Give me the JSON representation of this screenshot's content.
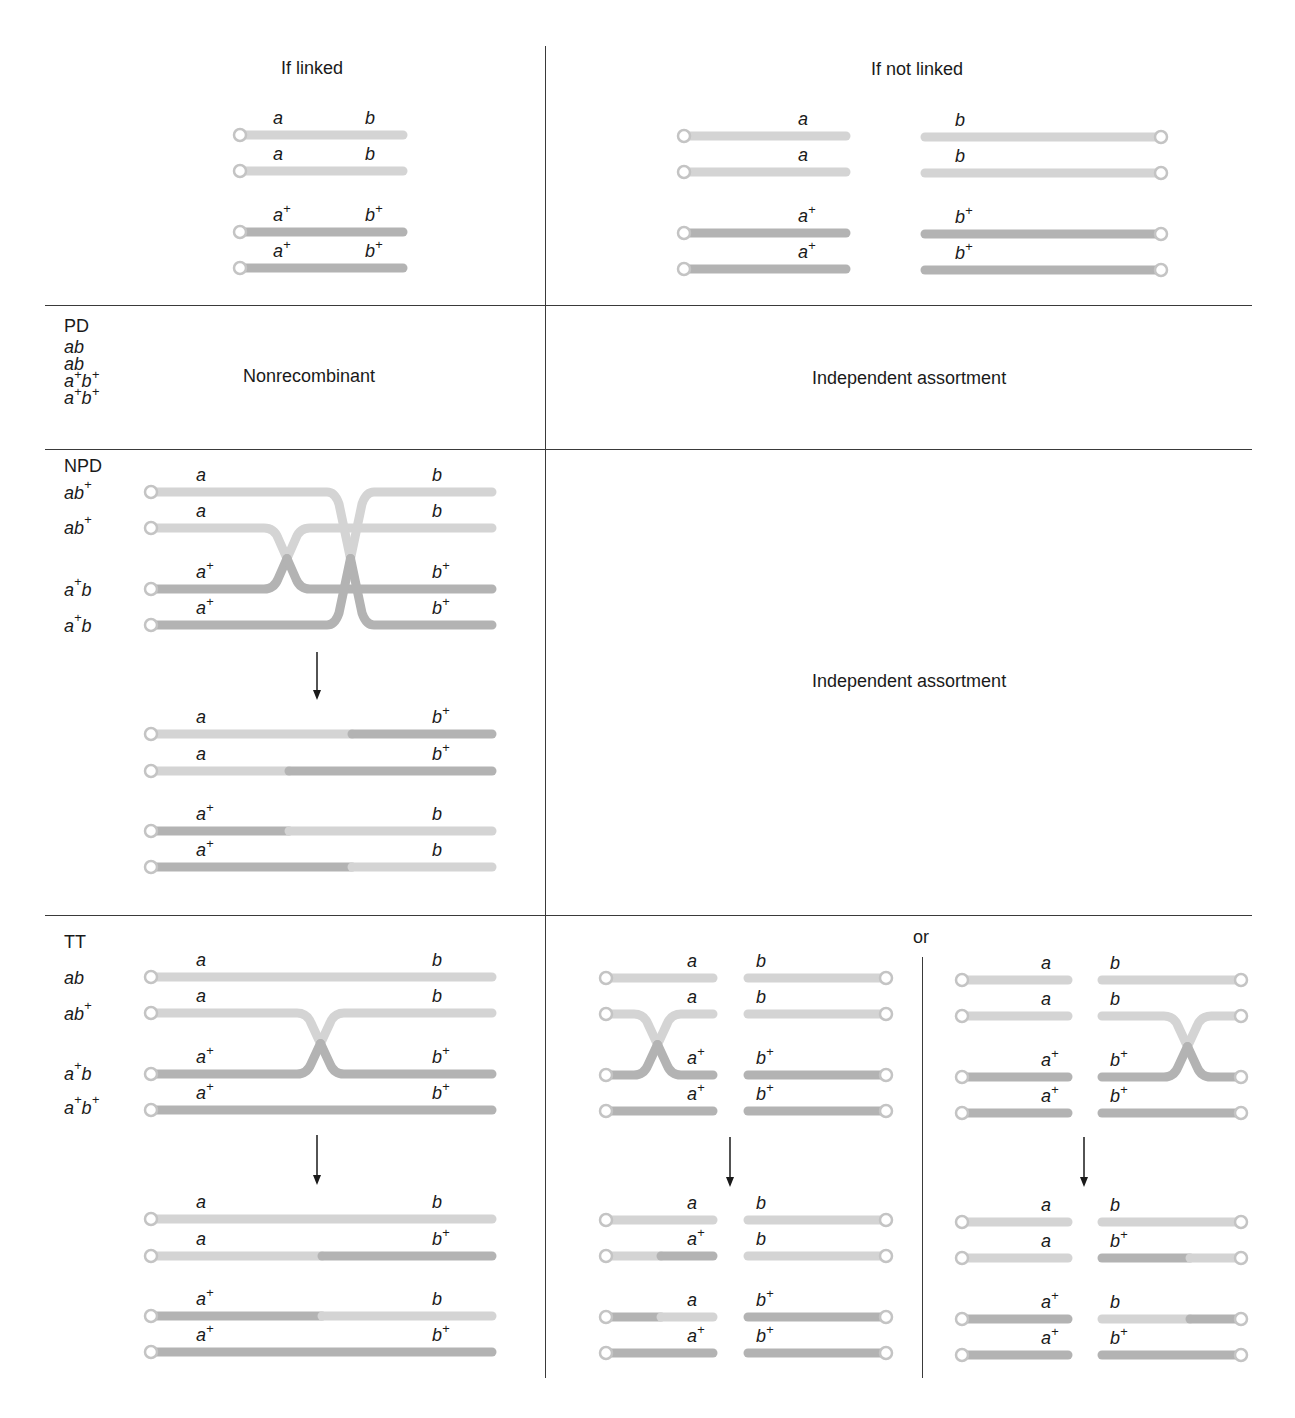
{
  "header": {
    "linked_title": "If linked",
    "not_linked_title": "If not linked"
  },
  "rows": {
    "pd": {
      "label": "PD",
      "genotypes": [
        "ab",
        "ab",
        "a+b+",
        "a+b+"
      ],
      "linked_text": "Nonrecombinant",
      "not_linked_text": "Independent assortment"
    },
    "npd": {
      "label": "NPD",
      "genotypes": [
        "ab+",
        "ab+",
        "a+b",
        "a+b"
      ],
      "not_linked_text": "Independent assortment"
    },
    "tt": {
      "label": "TT",
      "genotypes": [
        "ab",
        "ab+",
        "a+b",
        "a+b+"
      ],
      "or_label": "or"
    }
  },
  "colors": {
    "light_chromatid": "#d4d4d4",
    "dark_chromatid": "#b3b3b3",
    "centromere_stroke": "#c4c4c4",
    "grid_line": "#3a3a3a",
    "arrow": "#1a1a1a"
  },
  "grid": {
    "h_lines_y": [
      305,
      449,
      915
    ],
    "v_line_x": 545,
    "or_divider_x": 922
  },
  "diagrams": [
    {
      "id": "linked-parent",
      "cen": "left",
      "x1": 240,
      "x2": 403,
      "strands": [
        {
          "y": 135,
          "left": "a",
          "right": "b",
          "segs": [
            [
              "L",
              240,
              403
            ]
          ]
        },
        {
          "y": 171,
          "left": "a",
          "right": "b",
          "segs": [
            [
              "L",
              240,
              403
            ]
          ]
        },
        {
          "y": 232,
          "left": "a+",
          "right": "b+",
          "segs": [
            [
              "D",
              240,
              403
            ]
          ]
        },
        {
          "y": 268,
          "left": "a+",
          "right": "b+",
          "segs": [
            [
              "D",
              240,
              403
            ]
          ]
        }
      ],
      "label_left_x": 273,
      "label_right_x": 365
    },
    {
      "id": "unlinked-parent-a",
      "cen": "left",
      "x1": 684,
      "x2": 846,
      "strands": [
        {
          "y": 136,
          "left": "a",
          "segs": [
            [
              "L",
              684,
              846
            ]
          ]
        },
        {
          "y": 172,
          "left": "a",
          "segs": [
            [
              "L",
              684,
              846
            ]
          ]
        },
        {
          "y": 233,
          "left": "a+",
          "segs": [
            [
              "D",
              684,
              846
            ]
          ]
        },
        {
          "y": 269,
          "left": "a+",
          "segs": [
            [
              "D",
              684,
              846
            ]
          ]
        }
      ],
      "label_left_x": 798
    },
    {
      "id": "unlinked-parent-b",
      "cen": "right",
      "x1": 925,
      "x2": 1161,
      "strands": [
        {
          "y": 137,
          "right": "b",
          "segs": [
            [
              "L",
              925,
              1161
            ]
          ]
        },
        {
          "y": 173,
          "right": "b",
          "segs": [
            [
              "L",
              925,
              1161
            ]
          ]
        },
        {
          "y": 234,
          "right": "b+",
          "segs": [
            [
              "D",
              925,
              1161
            ]
          ]
        },
        {
          "y": 270,
          "right": "b+",
          "segs": [
            [
              "D",
              925,
              1161
            ]
          ]
        }
      ],
      "label_right_x": 955
    },
    {
      "id": "npd-result",
      "cen": "left",
      "x1": 151,
      "x2": 492,
      "strands": [
        {
          "y": 734,
          "left": "a",
          "right": "b+",
          "segs": [
            [
              "L",
              151,
              352
            ],
            [
              "D",
              352,
              492
            ]
          ]
        },
        {
          "y": 771,
          "left": "a",
          "right": "b+",
          "segs": [
            [
              "L",
              151,
              289
            ],
            [
              "D",
              289,
              492
            ]
          ]
        },
        {
          "y": 831,
          "left": "a+",
          "right": "b",
          "segs": [
            [
              "D",
              151,
              289
            ],
            [
              "L",
              289,
              492
            ]
          ]
        },
        {
          "y": 867,
          "left": "a+",
          "right": "b",
          "segs": [
            [
              "D",
              151,
              352
            ],
            [
              "L",
              352,
              492
            ]
          ]
        }
      ],
      "label_left_x": 196,
      "label_right_x": 432
    },
    {
      "id": "tt-linked-parent",
      "cen": "left",
      "x1": 151,
      "x2": 492,
      "strands": [
        {
          "y": 977,
          "left": "a",
          "right": "b",
          "segs": [
            [
              "L",
              151,
              492
            ]
          ]
        },
        {
          "y": 1013,
          "left": "a",
          "right": "b",
          "segs": []
        },
        {
          "y": 1074,
          "left": "a+",
          "right": "b+",
          "segs": []
        },
        {
          "y": 1110,
          "left": "a+",
          "right": "b+",
          "segs": [
            [
              "D",
              151,
              492
            ]
          ]
        }
      ],
      "label_left_x": 196,
      "label_right_x": 432
    },
    {
      "id": "tt-linked-result",
      "cen": "left",
      "x1": 151,
      "x2": 492,
      "strands": [
        {
          "y": 1219,
          "left": "a",
          "right": "b",
          "segs": [
            [
              "L",
              151,
              492
            ]
          ]
        },
        {
          "y": 1256,
          "left": "a",
          "right": "b+",
          "segs": [
            [
              "L",
              151,
              322
            ],
            [
              "D",
              322,
              492
            ]
          ]
        },
        {
          "y": 1316,
          "left": "a+",
          "right": "b",
          "segs": [
            [
              "D",
              151,
              322
            ],
            [
              "L",
              322,
              492
            ]
          ]
        },
        {
          "y": 1352,
          "left": "a+",
          "right": "b+",
          "segs": [
            [
              "D",
              151,
              492
            ]
          ]
        }
      ],
      "label_left_x": 196,
      "label_right_x": 432
    },
    {
      "id": "tt-unlinked1-parent-a",
      "cen": "left",
      "x1": 606,
      "x2": 713,
      "strands": [
        {
          "y": 978,
          "left": "a",
          "segs": [
            [
              "L",
              606,
              713
            ]
          ]
        },
        {
          "y": 1014,
          "left": "a",
          "segs": []
        },
        {
          "y": 1075,
          "left": "a+",
          "segs": []
        },
        {
          "y": 1111,
          "left": "a+",
          "segs": [
            [
              "D",
              606,
              713
            ]
          ]
        }
      ],
      "label_left_x": 687
    },
    {
      "id": "tt-unlinked1-parent-b",
      "cen": "right",
      "x1": 748,
      "x2": 886,
      "strands": [
        {
          "y": 978,
          "right": "b",
          "segs": [
            [
              "L",
              748,
              886
            ]
          ]
        },
        {
          "y": 1014,
          "right": "b",
          "segs": [
            [
              "L",
              748,
              886
            ]
          ]
        },
        {
          "y": 1075,
          "right": "b+",
          "segs": [
            [
              "D",
              748,
              886
            ]
          ]
        },
        {
          "y": 1111,
          "right": "b+",
          "segs": [
            [
              "D",
              748,
              886
            ]
          ]
        }
      ],
      "label_right_x": 756
    },
    {
      "id": "tt-unlinked1-result-a",
      "cen": "left",
      "x1": 606,
      "x2": 713,
      "strands": [
        {
          "y": 1220,
          "left": "a",
          "segs": [
            [
              "L",
              606,
              713
            ]
          ]
        },
        {
          "y": 1256,
          "left": "a+",
          "segs": [
            [
              "L",
              606,
              661
            ],
            [
              "D",
              661,
              713
            ]
          ]
        },
        {
          "y": 1317,
          "left": "a",
          "segs": [
            [
              "D",
              606,
              661
            ],
            [
              "L",
              661,
              713
            ]
          ]
        },
        {
          "y": 1353,
          "left": "a+",
          "segs": [
            [
              "D",
              606,
              713
            ]
          ]
        }
      ],
      "label_left_x": 687
    },
    {
      "id": "tt-unlinked1-result-b",
      "cen": "right",
      "x1": 748,
      "x2": 886,
      "strands": [
        {
          "y": 1220,
          "right": "b",
          "segs": [
            [
              "L",
              748,
              886
            ]
          ]
        },
        {
          "y": 1256,
          "right": "b",
          "segs": [
            [
              "L",
              748,
              886
            ]
          ]
        },
        {
          "y": 1317,
          "right": "b+",
          "segs": [
            [
              "D",
              748,
              886
            ]
          ]
        },
        {
          "y": 1353,
          "right": "b+",
          "segs": [
            [
              "D",
              748,
              886
            ]
          ]
        }
      ],
      "label_right_x": 756
    },
    {
      "id": "tt-unlinked2-parent-a",
      "cen": "left",
      "x1": 962,
      "x2": 1068,
      "strands": [
        {
          "y": 980,
          "left": "a",
          "segs": [
            [
              "L",
              962,
              1068
            ]
          ]
        },
        {
          "y": 1016,
          "left": "a",
          "segs": [
            [
              "L",
              962,
              1068
            ]
          ]
        },
        {
          "y": 1077,
          "left": "a+",
          "segs": [
            [
              "D",
              962,
              1068
            ]
          ]
        },
        {
          "y": 1113,
          "left": "a+",
          "segs": [
            [
              "D",
              962,
              1068
            ]
          ]
        }
      ],
      "label_left_x": 1041
    },
    {
      "id": "tt-unlinked2-parent-b",
      "cen": "right",
      "x1": 1102,
      "x2": 1241,
      "strands": [
        {
          "y": 980,
          "right": "b",
          "segs": [
            [
              "L",
              1102,
              1241
            ]
          ]
        },
        {
          "y": 1016,
          "right": "b",
          "segs": []
        },
        {
          "y": 1077,
          "right": "b+",
          "segs": []
        },
        {
          "y": 1113,
          "right": "b+",
          "segs": [
            [
              "D",
              1102,
              1241
            ]
          ]
        }
      ],
      "label_right_x": 1110
    },
    {
      "id": "tt-unlinked2-result-a",
      "cen": "left",
      "x1": 962,
      "x2": 1068,
      "strands": [
        {
          "y": 1222,
          "left": "a",
          "segs": [
            [
              "L",
              962,
              1068
            ]
          ]
        },
        {
          "y": 1258,
          "left": "a",
          "segs": [
            [
              "L",
              962,
              1068
            ]
          ]
        },
        {
          "y": 1319,
          "left": "a+",
          "segs": [
            [
              "D",
              962,
              1068
            ]
          ]
        },
        {
          "y": 1355,
          "left": "a+",
          "segs": [
            [
              "D",
              962,
              1068
            ]
          ]
        }
      ],
      "label_left_x": 1041
    },
    {
      "id": "tt-unlinked2-result-b",
      "cen": "right",
      "x1": 1102,
      "x2": 1241,
      "strands": [
        {
          "y": 1222,
          "right": "b",
          "segs": [
            [
              "L",
              1102,
              1241
            ]
          ]
        },
        {
          "y": 1258,
          "right": "b+",
          "segs": [
            [
              "D",
              1102,
              1190
            ],
            [
              "L",
              1190,
              1241
            ]
          ]
        },
        {
          "y": 1319,
          "right": "b",
          "segs": [
            [
              "L",
              1102,
              1190
            ],
            [
              "D",
              1190,
              1241
            ]
          ]
        },
        {
          "y": 1355,
          "right": "b+",
          "segs": [
            [
              "D",
              1102,
              1241
            ]
          ]
        }
      ],
      "label_right_x": 1110
    }
  ],
  "crossovers": [
    {
      "id": "npd-cross-left",
      "upper_y": 528,
      "lower_y": 589,
      "x_start": 270,
      "x_end": 304,
      "upper_color": "L",
      "lower_color": "D",
      "upper_left_from": 151,
      "upper_right_to": 492,
      "lower_left_from": 151,
      "lower_right_to": null
    },
    {
      "id": "npd-cross-right",
      "upper_y": 492,
      "lower_y": 625,
      "x_start": 333,
      "x_end": 368,
      "upper_color": "L",
      "lower_color": "D"
    },
    {
      "id": "tt-cross",
      "upper_y": 1013,
      "lower_y": 1074,
      "x_start": 303,
      "x_end": 338,
      "upper_color": "L",
      "lower_color": "D"
    },
    {
      "id": "tt-unlinked1-cross",
      "upper_y": 1014,
      "lower_y": 1075,
      "x_start": 640,
      "x_end": 675,
      "upper_color": "L",
      "lower_color": "D"
    },
    {
      "id": "tt-unlinked2-cross",
      "upper_y": 1016,
      "lower_y": 1077,
      "x_start": 1170,
      "x_end": 1205,
      "upper_color": "L",
      "lower_color": "D"
    }
  ],
  "arrows": [
    {
      "id": "npd-arrow",
      "x": 317,
      "y1": 652,
      "y2": 700
    },
    {
      "id": "tt-linked-arrow",
      "x": 317,
      "y1": 1135,
      "y2": 1185
    },
    {
      "id": "tt-unlinked1-arrow",
      "x": 730,
      "y1": 1137,
      "y2": 1187
    },
    {
      "id": "tt-unlinked2-arrow",
      "x": 1084,
      "y1": 1137,
      "y2": 1187
    }
  ]
}
